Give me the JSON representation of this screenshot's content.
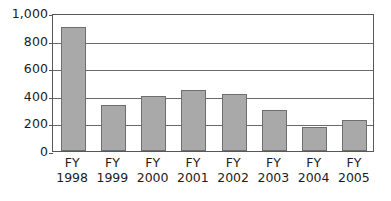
{
  "chart_data": {
    "type": "bar",
    "title": "",
    "subtitle": "",
    "xlabel": "",
    "ylabel": "",
    "categories": [
      "FY 1998",
      "FY 1999",
      "FY 2000",
      "FY 2001",
      "FY 2002",
      "FY 2003",
      "FY 2004",
      "FY 2005"
    ],
    "category_lines": [
      {
        "prefix": "FY",
        "year": "1998"
      },
      {
        "prefix": "FY",
        "year": "1999"
      },
      {
        "prefix": "FY",
        "year": "2000"
      },
      {
        "prefix": "FY",
        "year": "2001"
      },
      {
        "prefix": "FY",
        "year": "2002"
      },
      {
        "prefix": "FY",
        "year": "2003"
      },
      {
        "prefix": "FY",
        "year": "2004"
      },
      {
        "prefix": "FY",
        "year": "2005"
      }
    ],
    "values": [
      900,
      330,
      400,
      440,
      415,
      300,
      175,
      225
    ],
    "ylim": [
      0,
      1000
    ],
    "ytick_values": [
      0,
      200,
      400,
      600,
      800,
      1000
    ],
    "ytick_labels": [
      "0",
      "200",
      "400",
      "600",
      "800",
      "1,000"
    ],
    "grid": true,
    "grid_axis": "y",
    "legend": false,
    "legend_position": "none",
    "bar_fill_color": "#a9a9a9",
    "bar_border_color": "#6e6e6e",
    "gridline_color": "#6b6b6b",
    "frame_color": "#585858",
    "background_color": "#ffffff",
    "text_color": "#1c1c1c"
  }
}
